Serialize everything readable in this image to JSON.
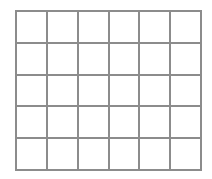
{
  "grid": {
    "rows": 5,
    "columns": 6,
    "line_color": "#8c8c8c",
    "background": "#ffffff",
    "cells": [
      [
        "",
        "",
        "",
        "",
        "",
        ""
      ],
      [
        "",
        "",
        "",
        "",
        "",
        ""
      ],
      [
        "",
        "",
        "",
        "",
        "",
        ""
      ],
      [
        "",
        "",
        "",
        "",
        "",
        ""
      ],
      [
        "",
        "",
        "",
        "",
        "",
        ""
      ]
    ]
  }
}
